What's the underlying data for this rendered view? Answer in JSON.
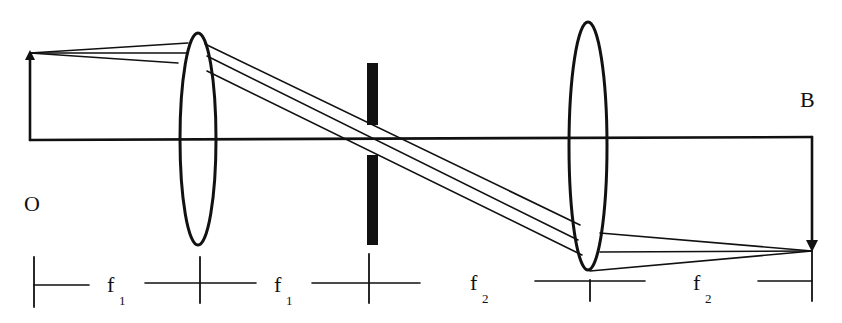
{
  "diagram": {
    "type": "optical-4f-system",
    "labels": {
      "object": "O",
      "image": "B"
    },
    "scale": [
      {
        "symbol": "f",
        "subscript": "1"
      },
      {
        "symbol": "f",
        "subscript": "1"
      },
      {
        "symbol": "f",
        "subscript": "2"
      },
      {
        "symbol": "f",
        "subscript": "2"
      }
    ],
    "elements": [
      "object-arrow",
      "lens-1",
      "aperture-stop",
      "lens-2",
      "image-arrow",
      "optical-axis"
    ],
    "colors": {
      "ink": "#111111",
      "background": "#ffffff"
    }
  }
}
